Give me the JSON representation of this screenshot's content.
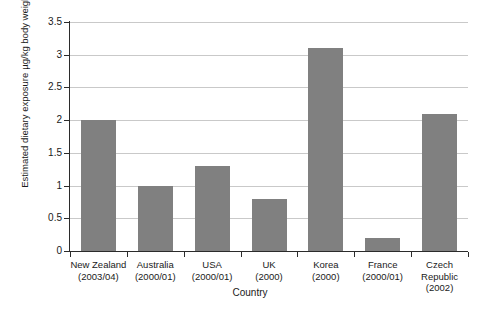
{
  "chart_data": {
    "type": "bar",
    "title": "",
    "xlabel": "Country",
    "ylabel_line1": "Estimated dietary exposure",
    "ylabel_line2": "µg/kg body weight/week",
    "categories": [
      "New Zealand",
      "Australia",
      "USA",
      "UK",
      "Korea",
      "France",
      "Czech Republic"
    ],
    "category_sublabels": [
      "(2003/04)",
      "(2000/01)",
      "(2000/01)",
      "(2000)",
      "(2000)",
      "(2000/01)",
      "(2002)"
    ],
    "values": [
      2.0,
      1.0,
      1.3,
      0.8,
      3.1,
      0.2,
      2.1
    ],
    "ylim": [
      0,
      3.5
    ],
    "ytick_labels": [
      "0",
      "0.5",
      "1",
      "1.5",
      "2",
      "2.5",
      "3",
      "3.5"
    ],
    "ytick_values": [
      0,
      0.5,
      1,
      1.5,
      2,
      2.5,
      3,
      3.5
    ],
    "grid": true,
    "legend": false,
    "bar_color": "#808080",
    "gridline_color": "#c9c9c9",
    "axis_color": "#2b2b2b",
    "background_color": "#ffffff"
  }
}
